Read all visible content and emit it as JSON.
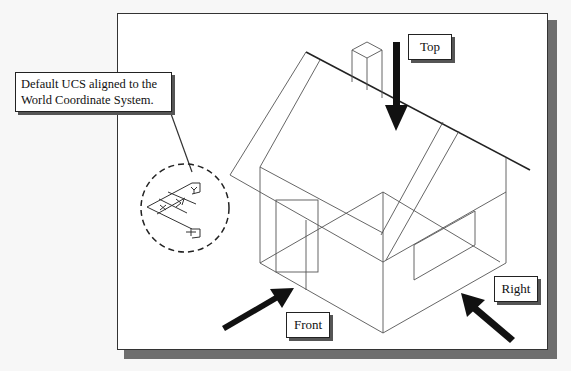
{
  "figure": {
    "callout": {
      "line1": "Default UCS aligned to the",
      "line2": "World Coordinate System."
    },
    "view_labels": {
      "top": "Top",
      "right": "Right",
      "front": "Front"
    },
    "ucs_icon": {
      "axes": [
        "X",
        "Y",
        "Z"
      ]
    },
    "colors": {
      "frame_border": "#333333",
      "frame_shadow": "#6e6e6e",
      "line": "#555555",
      "arrow": "#111111",
      "background": "#ffffff"
    }
  }
}
